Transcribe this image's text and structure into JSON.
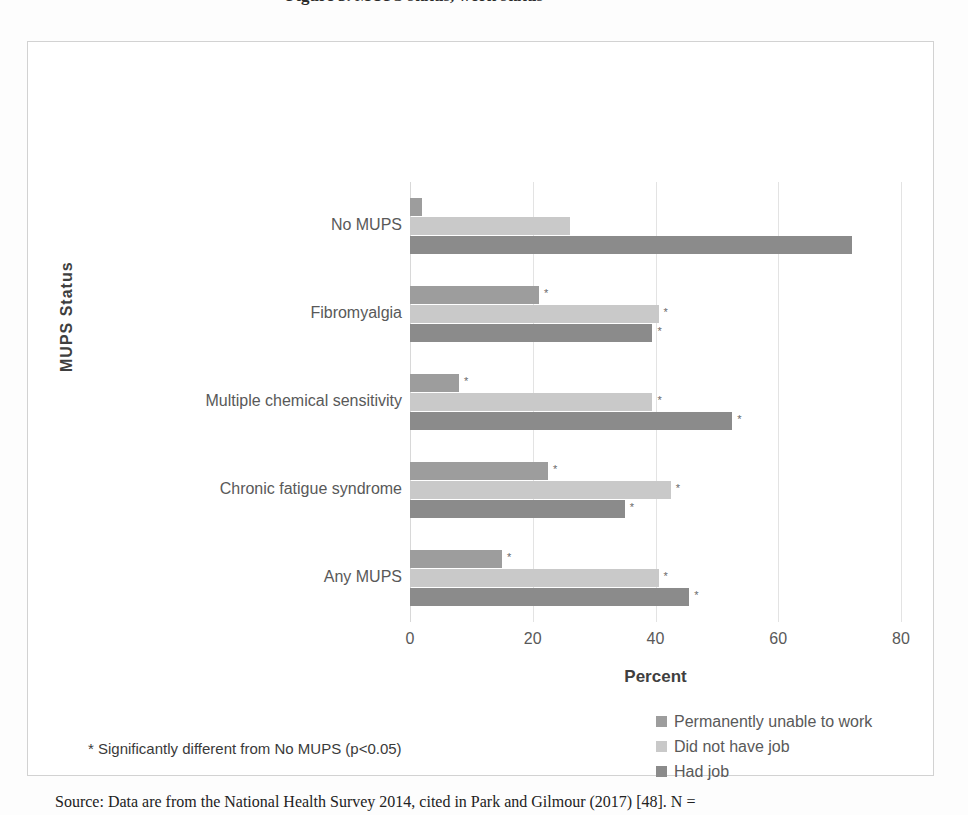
{
  "figure": {
    "title_sliver": "Figure 3. MUPS status, work status",
    "caption": "Source: Data are from the National Health Survey 2014, cited in Park and Gilmour (2017) [48]. N ="
  },
  "footnote": "* Significantly different from No MUPS (p<0.05)",
  "legend": {
    "position": "bottom-right",
    "items": [
      {
        "label": "Permanently unable to work",
        "color": "#9d9d9d"
      },
      {
        "label": "Did not have job",
        "color": "#c9c9c9"
      },
      {
        "label": "Had job",
        "color": "#8b8b8b"
      }
    ]
  },
  "chart_data": {
    "type": "bar",
    "orientation": "horizontal",
    "title": "",
    "xlabel": "Percent",
    "ylabel": "MUPS  Status",
    "xlim": [
      0,
      80
    ],
    "xticks": [
      0,
      20,
      40,
      60,
      80
    ],
    "grid": true,
    "categories": [
      "No MUPS",
      "Fibromyalgia",
      "Multiple chemical sensitivity",
      "Chronic fatigue syndrome",
      "Any MUPS"
    ],
    "series": [
      {
        "name": "Permanently unable to work",
        "color": "#9d9d9d",
        "values": [
          2.0,
          21.0,
          8.0,
          22.5,
          15.0
        ],
        "significant": [
          false,
          true,
          true,
          true,
          true
        ]
      },
      {
        "name": "Did not have job",
        "color": "#c9c9c9",
        "values": [
          26.0,
          40.5,
          39.5,
          42.5,
          40.5
        ],
        "significant": [
          false,
          true,
          true,
          true,
          true
        ]
      },
      {
        "name": "Had job",
        "color": "#8b8b8b",
        "values": [
          72.0,
          39.5,
          52.5,
          35.0,
          45.5
        ],
        "significant": [
          false,
          true,
          true,
          true,
          true
        ]
      }
    ],
    "significance_marker": "*",
    "significance_note": "* Significantly different from No MUPS (p<0.05)"
  }
}
